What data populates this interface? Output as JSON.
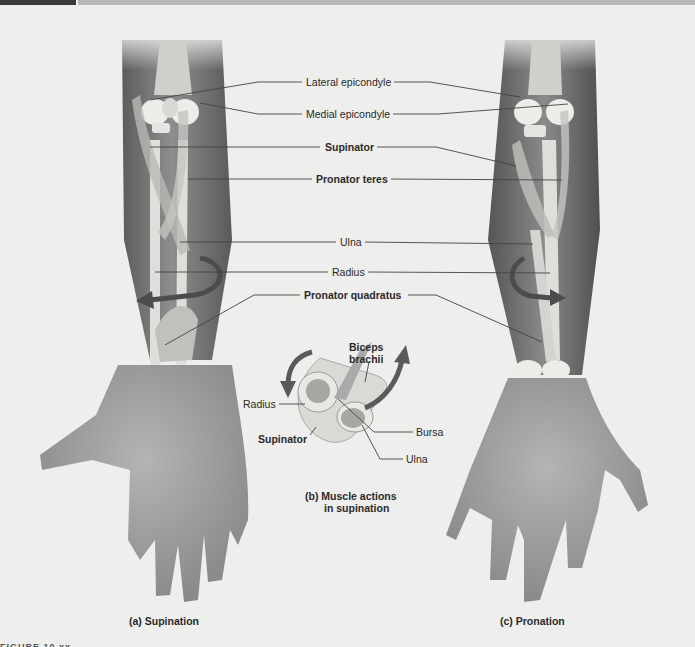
{
  "figure": {
    "labels": {
      "lateral_epicondyle": "Lateral epicondyle",
      "medial_epicondyle": "Medial epicondyle",
      "supinator": "Supinator",
      "pronator_teres": "Pronator teres",
      "ulna": "Ulna",
      "radius": "Radius",
      "pronator_quadratus": "Pronator quadratus"
    },
    "inset": {
      "biceps_brachii_line1": "Biceps",
      "biceps_brachii_line2": "brachii",
      "radius": "Radius",
      "supinator": "Supinator",
      "bursa": "Bursa",
      "ulna": "Ulna",
      "caption_line1": "(b)  Muscle actions",
      "caption_line2": "in supination"
    },
    "captions": {
      "a": "(a)  Supination",
      "c": "(c)  Pronation"
    },
    "footer": "FIGURE 10.xx"
  },
  "colors": {
    "background": "#eeeeec",
    "skin_dark": "#6e6e6e",
    "skin_light": "#a8a8a8",
    "bone": "#e4e4e0",
    "arrow": "#5a5a5a"
  }
}
